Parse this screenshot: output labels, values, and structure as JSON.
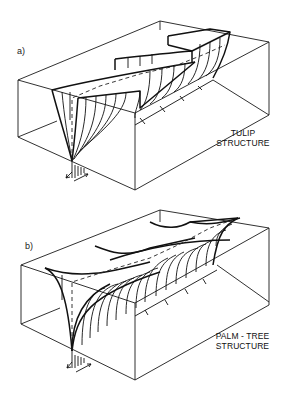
{
  "figure": {
    "panels": [
      {
        "id": "a",
        "label": "a)",
        "caption_line1": "TULIP",
        "caption_line2": "STRUCTURE",
        "structure_type": "tulip"
      },
      {
        "id": "b",
        "label": "b)",
        "caption_line1": "PALM - TREE",
        "caption_line2": "STRUCTURE",
        "structure_type": "palm-tree"
      }
    ],
    "colors": {
      "line": "#111111",
      "background": "#ffffff"
    }
  }
}
